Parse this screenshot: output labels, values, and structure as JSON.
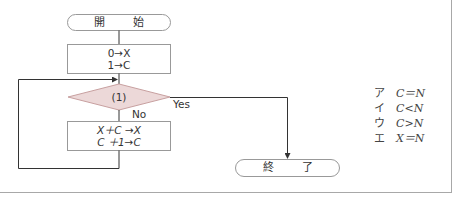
{
  "flowchart": {
    "start": {
      "label": "開 始"
    },
    "init": {
      "line1": "0→X",
      "line2": "1→C"
    },
    "decision": {
      "label": "(1)",
      "yes_label": "Yes",
      "no_label": "No"
    },
    "update": {
      "line1": "X＋C →X",
      "line2": "C ＋1→C"
    },
    "end": {
      "label": "終 了"
    }
  },
  "options": [
    {
      "key": "ア",
      "expr": "C＝N"
    },
    {
      "key": "イ",
      "expr": "C<N"
    },
    {
      "key": "ウ",
      "expr": "C>N"
    },
    {
      "key": "エ",
      "expr": "X＝N"
    }
  ],
  "colors": {
    "decision_fill": "#ecd8d8",
    "decision_stroke": "#c8a0a0",
    "line": "#333333",
    "box_stroke": "#999999",
    "frame": "#a8a8a8"
  }
}
